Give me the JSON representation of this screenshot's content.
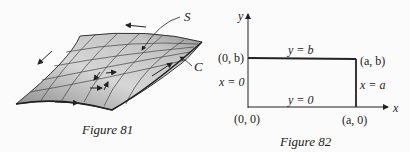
{
  "figure81": {
    "caption": "Figure 81",
    "labels": {
      "surface": "S",
      "boundary": "C"
    }
  },
  "figure82": {
    "caption": "Figure 82",
    "axes": {
      "x": "x",
      "y": "y"
    },
    "corners": {
      "origin": "(0, 0)",
      "top_left": "(0, b)",
      "top_right": "(a, b)",
      "bottom_right": "(a, 0)"
    },
    "edges": {
      "top": "y = b",
      "bottom": "y = 0",
      "left": "x = 0",
      "right": "x = a"
    }
  },
  "colors": {
    "ink": "#222222",
    "surface_light": "#d4d4d4",
    "surface_dark": "#8a8a8a",
    "background": "#fbfbfb"
  }
}
